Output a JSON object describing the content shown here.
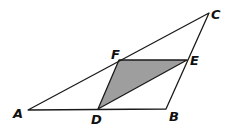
{
  "diagram": {
    "type": "geometry",
    "colors": {
      "stroke": "#1a1a1a",
      "shade": "#9e9e9e",
      "background": "#ffffff"
    },
    "points": {
      "A": {
        "label": "A",
        "x": 28,
        "y": 110
      },
      "B": {
        "label": "B",
        "x": 166,
        "y": 109
      },
      "C": {
        "label": "C",
        "x": 209,
        "y": 13
      },
      "D": {
        "label": "D",
        "x": 98,
        "y": 109
      },
      "E": {
        "label": "E",
        "x": 187,
        "y": 60
      },
      "F": {
        "label": "F",
        "x": 119,
        "y": 60
      }
    },
    "labels": {
      "A": {
        "text": "A",
        "x": 13,
        "y": 118
      },
      "B": {
        "text": "B",
        "x": 169,
        "y": 121
      },
      "C": {
        "text": "C",
        "x": 211,
        "y": 19
      },
      "D": {
        "text": "D",
        "x": 91,
        "y": 124
      },
      "E": {
        "text": "E",
        "x": 190,
        "y": 65
      },
      "F": {
        "text": "F",
        "x": 111,
        "y": 59
      }
    },
    "segments": [
      "AB",
      "BC",
      "CA",
      "DF",
      "FE",
      "ED"
    ],
    "shaded_region": "DFE"
  }
}
